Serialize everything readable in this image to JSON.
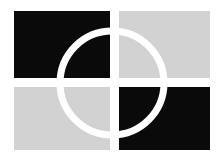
{
  "artwork": {
    "name": "quadrant-ring-emblem",
    "type": "logo-mark",
    "canvas": {
      "width": 220,
      "height": 164,
      "background_color": "#ffffff"
    },
    "palette": {
      "dark": "#0a0a0a",
      "light": "#d2d2d2",
      "gap": "#ffffff",
      "ring": "#ffffff"
    },
    "block_group": {
      "name": "four-quadrant-blocks",
      "left": 14,
      "top": 11,
      "right": 210,
      "bottom": 150,
      "gap_x_start": 110,
      "gap_x_end": 119,
      "gap_y_start": 78,
      "gap_y_end": 87,
      "quadrants": [
        {
          "name": "top-left-block",
          "fill": "#0a0a0a",
          "x": 14,
          "y": 11,
          "w": 96,
          "h": 67
        },
        {
          "name": "top-right-block",
          "fill": "#d2d2d2",
          "x": 119,
          "y": 11,
          "w": 91,
          "h": 67
        },
        {
          "name": "bottom-left-block",
          "fill": "#d2d2d2",
          "x": 14,
          "y": 87,
          "w": 96,
          "h": 63
        },
        {
          "name": "bottom-right-block",
          "fill": "#0a0a0a",
          "x": 119,
          "y": 87,
          "w": 91,
          "h": 63
        }
      ]
    },
    "ring": {
      "name": "overlay-ring",
      "center_x": 112,
      "center_y": 83,
      "radius": 52,
      "stroke_width": 7,
      "stroke_color": "#ffffff",
      "fill": "none"
    }
  }
}
